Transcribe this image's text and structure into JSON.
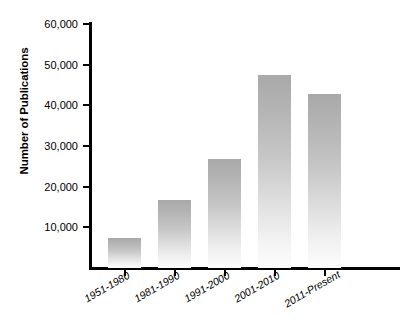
{
  "chart_data": {
    "type": "bar",
    "title": "",
    "subtitle": "",
    "xlabel": "",
    "ylabel": "Number of Publications",
    "categories": [
      "1951-1980",
      "1981-1990",
      "1991-2000",
      "2001-2010",
      "2011-Present"
    ],
    "values": [
      7500,
      16800,
      26800,
      47500,
      42700
    ],
    "ylim": [
      0,
      60000
    ],
    "ytick_values": [
      10000,
      20000,
      30000,
      40000,
      50000,
      60000
    ],
    "ytick_labels": [
      "10,000",
      "20,000",
      "30,000",
      "40,000",
      "50,000",
      "60,000"
    ],
    "grid": false,
    "legend": false,
    "legend_position": "none",
    "bar_color_top": "#a9a9a9",
    "bar_color_bottom": "#fdfdfd",
    "axis_color": "#000000",
    "background_color": "#ffffff"
  }
}
